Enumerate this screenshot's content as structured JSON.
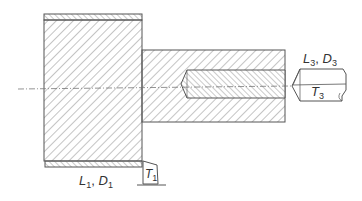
{
  "diagram": {
    "type": "machining-cross-section",
    "colors": {
      "outline": "#555555",
      "hatch": "#8a8a8a",
      "background": "#ffffff",
      "text": "#333333"
    },
    "labels": {
      "l1d1": {
        "main1": "L",
        "sub1": "1",
        "sep": ", ",
        "main2": "D",
        "sub2": "1"
      },
      "t1": {
        "main": "T",
        "sub": "1"
      },
      "l3d3": {
        "main1": "L",
        "sub1": "3",
        "sep": ", ",
        "main2": "D",
        "sub2": "3"
      },
      "t3": {
        "main": "T",
        "sub": "3"
      }
    },
    "parts": [
      {
        "name": "large-cylinder",
        "label": "L1, D1"
      },
      {
        "name": "small-shaft"
      },
      {
        "name": "drilled-bore"
      },
      {
        "name": "turning-tool",
        "label": "T1"
      },
      {
        "name": "drill-tool",
        "label": "T3"
      },
      {
        "name": "centerline"
      }
    ]
  }
}
